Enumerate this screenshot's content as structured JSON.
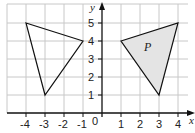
{
  "diagram": {
    "type": "coordinate-grid",
    "x_axis": {
      "label": "x",
      "min": -4,
      "max": 4,
      "ticks": [
        "-4",
        "-3",
        "-2",
        "-1",
        "1",
        "2",
        "3",
        "4"
      ],
      "origin_label": "0"
    },
    "y_axis": {
      "label": "y",
      "min": 0,
      "max": 5,
      "ticks": [
        "1",
        "2",
        "3",
        "4",
        "5"
      ]
    },
    "shapes": [
      {
        "name": "triangle-left",
        "vertices": [
          [
            -4,
            5
          ],
          [
            -1,
            4
          ],
          [
            -3,
            1
          ]
        ],
        "fill": "none",
        "label": ""
      },
      {
        "name": "triangle-P",
        "vertices": [
          [
            1,
            4
          ],
          [
            4,
            5
          ],
          [
            3,
            1
          ]
        ],
        "fill": "#e4e4e4",
        "label": "P"
      }
    ],
    "colors": {
      "grid": "#c8c8c8",
      "axis": "#111111",
      "shape_stroke": "#111111",
      "shape_fill": "#e4e4e4"
    }
  },
  "labels": {
    "x_axis": "x",
    "y_axis": "y",
    "origin": "0",
    "shape_p": "P",
    "x_ticks": [
      "-4",
      "-3",
      "-2",
      "-1",
      "1",
      "2",
      "3",
      "4"
    ],
    "y_ticks": [
      "1",
      "2",
      "3",
      "4",
      "5"
    ]
  }
}
